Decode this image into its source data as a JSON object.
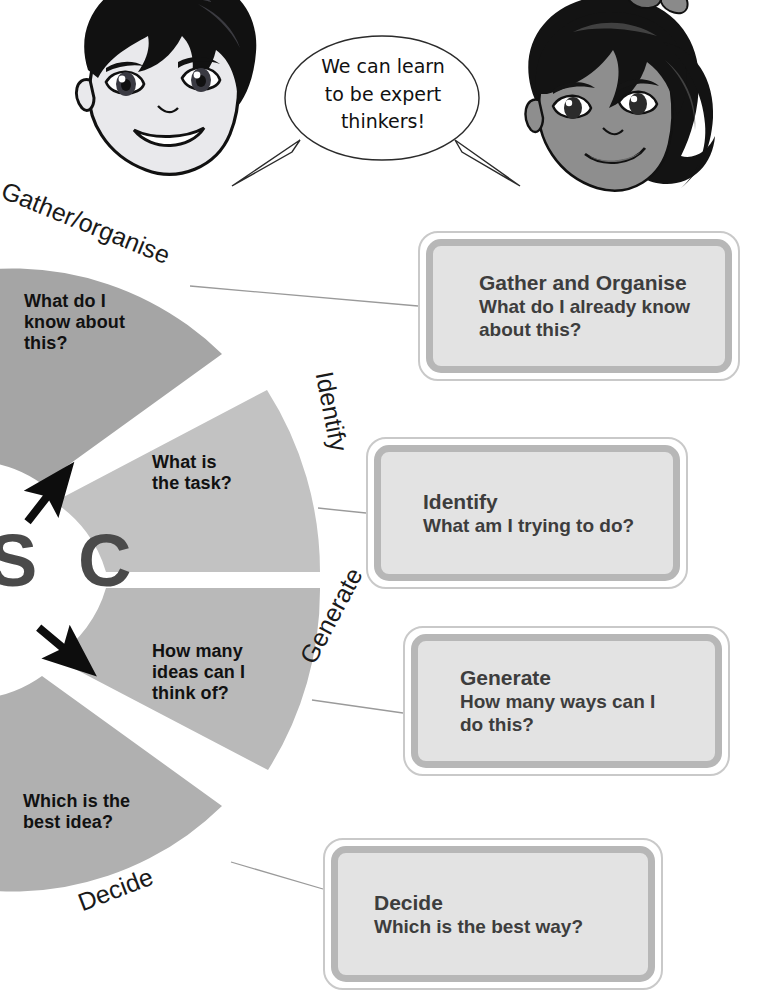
{
  "characters": {
    "left": {
      "name": "boy-thinker-face"
    },
    "right": {
      "name": "girl-thinker-face"
    }
  },
  "speech_bubble": {
    "text": "We can learn\nto be expert\nthinkers!"
  },
  "wheel": {
    "hub_letters": "S C",
    "ring_labels": [
      {
        "id": "gather",
        "text": "Gather/organise"
      },
      {
        "id": "identify",
        "text": "Identify"
      },
      {
        "id": "generate",
        "text": "Generate"
      },
      {
        "id": "decide",
        "text": "Decide"
      }
    ],
    "segments": [
      {
        "id": "gather",
        "question": "What do I\nknow about\nthis?",
        "color": "#a5a5a5"
      },
      {
        "id": "identify",
        "question": "What is\nthe task?",
        "color": "#c2c2c2"
      },
      {
        "id": "generate",
        "question": "How many\nideas can I\nthink of?",
        "color": "#b9b9b9"
      },
      {
        "id": "decide",
        "question": "Which is the\nbest idea?",
        "color": "#b0b0b0"
      }
    ]
  },
  "cards": [
    {
      "id": "gather",
      "title": "Gather and Organise",
      "subtitle": "What do I already know\nabout this?"
    },
    {
      "id": "identify",
      "title": "Identify",
      "subtitle": "What am I trying to do?"
    },
    {
      "id": "generate",
      "title": "Generate",
      "subtitle": "How many ways can I\ndo this?"
    },
    {
      "id": "decide",
      "title": "Decide",
      "subtitle": "Which is the best way?"
    }
  ],
  "colors": {
    "card_fill": "#e3e3e3",
    "card_inner_border": "#b7b7b7",
    "card_outer_border": "#c9c9c9",
    "text_dark": "#3d3d3d",
    "connector_line": "#9a9a9a"
  }
}
